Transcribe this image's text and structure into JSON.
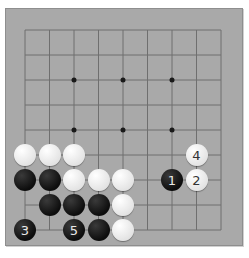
{
  "board": {
    "size": 9,
    "background_color": "#a9a9a9",
    "line_color": "#6f6f6f",
    "origin": {
      "x": 25,
      "y": 30
    },
    "spacing": {
      "x": 24.5,
      "y": 25
    },
    "star_points": [
      [
        2,
        2
      ],
      [
        4,
        2
      ],
      [
        6,
        2
      ],
      [
        2,
        4
      ],
      [
        4,
        4
      ],
      [
        6,
        4
      ],
      [
        2,
        6
      ],
      [
        4,
        6
      ],
      [
        6,
        6
      ]
    ]
  },
  "stones": [
    {
      "color": "white",
      "col": 0,
      "row": 5,
      "label": ""
    },
    {
      "color": "white",
      "col": 1,
      "row": 5,
      "label": ""
    },
    {
      "color": "white",
      "col": 2,
      "row": 5,
      "label": ""
    },
    {
      "color": "white",
      "col": 7,
      "row": 5,
      "label": "4"
    },
    {
      "color": "black",
      "col": 0,
      "row": 6,
      "label": ""
    },
    {
      "color": "black",
      "col": 1,
      "row": 6,
      "label": ""
    },
    {
      "color": "white",
      "col": 2,
      "row": 6,
      "label": ""
    },
    {
      "color": "white",
      "col": 3,
      "row": 6,
      "label": ""
    },
    {
      "color": "white",
      "col": 4,
      "row": 6,
      "label": ""
    },
    {
      "color": "black",
      "col": 6,
      "row": 6,
      "label": "1"
    },
    {
      "color": "white",
      "col": 7,
      "row": 6,
      "label": "2"
    },
    {
      "color": "black",
      "col": 1,
      "row": 7,
      "label": ""
    },
    {
      "color": "black",
      "col": 2,
      "row": 7,
      "label": ""
    },
    {
      "color": "black",
      "col": 3,
      "row": 7,
      "label": ""
    },
    {
      "color": "white",
      "col": 4,
      "row": 7,
      "label": ""
    },
    {
      "color": "black",
      "col": 0,
      "row": 8,
      "label": "3"
    },
    {
      "color": "black",
      "col": 2,
      "row": 8,
      "label": "5"
    },
    {
      "color": "black",
      "col": 3,
      "row": 8,
      "label": ""
    },
    {
      "color": "white",
      "col": 4,
      "row": 8,
      "label": ""
    }
  ]
}
